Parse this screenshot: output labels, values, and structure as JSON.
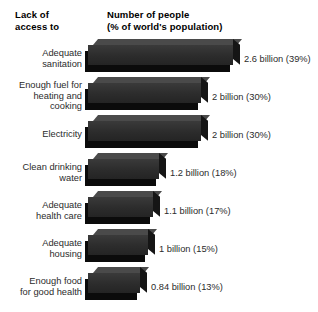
{
  "header": {
    "left": "Lack of\naccess to",
    "right": "Number of people\n(% of world's population)"
  },
  "chart_data": {
    "type": "bar",
    "orientation": "horizontal",
    "title": "",
    "xlabel": "Number of people (% of world's population)",
    "ylabel": "Lack of access to",
    "grid": false,
    "legend": false,
    "unit": "billion people",
    "categories": [
      "Adequate\nsanitation",
      "Enough fuel for\nheating and\ncooking",
      "Electricity",
      "Clean drinking\nwater",
      "Adequate\nhealth care",
      "Adequate\nhousing",
      "Enough food\nfor good health"
    ],
    "values": [
      2.6,
      2,
      2,
      1.2,
      1.1,
      1,
      0.84
    ],
    "percent": [
      39,
      30,
      30,
      18,
      17,
      15,
      13
    ],
    "value_labels": [
      "2.6 billion (39%)",
      "2 billion (30%)",
      "2 billion (30%)",
      "1.2 billion (18%)",
      "1.1 billion (17%)",
      "1 billion (15%)",
      "0.84 billion (13%)"
    ],
    "xlim": [
      0,
      2.6
    ],
    "bar_color": "#2e2e2e"
  },
  "rows": [
    {
      "label": "Adequate\nsanitation",
      "value_label": "2.6 billion (39%)",
      "bar_px": 145,
      "top": 45,
      "label_top": 48,
      "value_top": 54
    },
    {
      "label": "Enough fuel for\nheating and\ncooking",
      "value_label": "2 billion (30%)",
      "bar_px": 113,
      "top": 83,
      "label_top": 80,
      "value_top": 92
    },
    {
      "label": "Electricity",
      "value_label": "2 billion (30%)",
      "bar_px": 113,
      "top": 121,
      "label_top": 129,
      "value_top": 130
    },
    {
      "label": "Clean drinking\nwater",
      "value_label": "1.2 billion (18%)",
      "bar_px": 71,
      "top": 159,
      "label_top": 162,
      "value_top": 168
    },
    {
      "label": "Adequate\nhealth care",
      "value_label": "1.1 billion (17%)",
      "bar_px": 65,
      "top": 197,
      "label_top": 200,
      "value_top": 206
    },
    {
      "label": "Adequate\nhousing",
      "value_label": "1 billion (15%)",
      "bar_px": 60,
      "top": 235,
      "label_top": 238,
      "value_top": 244
    },
    {
      "label": "Enough food\nfor good health",
      "value_label": "0.84 billion (13%)",
      "bar_px": 52,
      "top": 273,
      "label_top": 276,
      "value_top": 282
    }
  ]
}
